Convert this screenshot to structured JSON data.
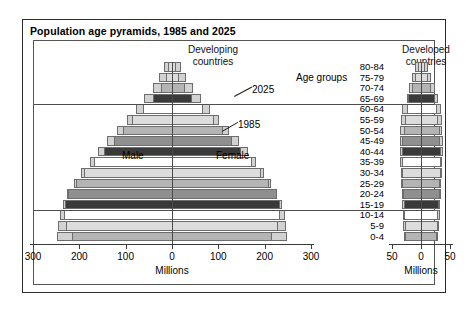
{
  "title": "Population age pyramids, 1985 and 2025",
  "panels": {
    "left_heading_line1": "Developing",
    "left_heading_line2": "countries",
    "right_heading_line1": "Developed",
    "right_heading_line2": "countries"
  },
  "annotations": {
    "male": "Male",
    "female": "Female",
    "year_outer": "2025",
    "year_inner": "1985",
    "age_groups_title": "Age groups"
  },
  "axis": {
    "left_title": "Millions",
    "right_title": "Millions",
    "left_ticks": [
      "300",
      "200",
      "100",
      "0",
      "100",
      "200",
      "300"
    ],
    "right_ticks": [
      "50",
      "0",
      "50"
    ]
  },
  "colors": {
    "outer_2025": "#d2d2d2",
    "bar_border": "#6d6d6d",
    "frame": "#2b2b2b",
    "text": "#000000",
    "shade_white": "#ffffff",
    "shade_light": "#dcdcdc",
    "shade_mid": "#b4b4b4",
    "shade_dark": "#8f8f8f",
    "shade_darker": "#707070",
    "shade_darkest": "#3a3a3a"
  },
  "chart_data": {
    "type": "bar",
    "title": "Population age pyramids, 1985 and 2025",
    "subtype": "population-pyramid",
    "xlabel": "Millions",
    "ylabel": "Age groups",
    "grid": false,
    "legend": [
      "2025",
      "1985"
    ],
    "age_groups": [
      "80-84",
      "75-79",
      "70-74",
      "65-69",
      "60-64",
      "55-59",
      "50-54",
      "45-49",
      "40-44",
      "35-39",
      "30-34",
      "25-29",
      "20-24",
      "15-19",
      "10-14",
      "5-9",
      "0-4"
    ],
    "panels": [
      {
        "name": "Developing countries",
        "xlim": [
          -300,
          300
        ],
        "xticks": [
          -300,
          -200,
          -100,
          0,
          100,
          200,
          300
        ],
        "series": [
          {
            "name": "2025",
            "male": [
              18,
              28,
              42,
              60,
              78,
              98,
              118,
              140,
              160,
              178,
              196,
              212,
              226,
              236,
              242,
              246,
              248
            ],
            "female": [
              20,
              30,
              45,
              63,
              82,
              102,
              122,
              144,
              163,
              181,
              198,
              214,
              227,
              237,
              243,
              246,
              248
            ]
          },
          {
            "name": "1985",
            "male": [
              8,
              14,
              24,
              40,
              62,
              86,
              106,
              126,
              146,
              168,
              190,
              208,
              224,
              232,
              234,
              228,
              216
            ],
            "female": [
              9,
              16,
              27,
              44,
              66,
              90,
              110,
              130,
              150,
              172,
              193,
              210,
              226,
              233,
              234,
              228,
              216
            ]
          }
        ],
        "shades": [
          "light",
          "light",
          "mid",
          "darkest",
          "white",
          "light",
          "mid",
          "dark",
          "darkest",
          "white",
          "light",
          "mid",
          "dark",
          "darkest",
          "white",
          "light",
          "mid"
        ]
      },
      {
        "name": "Developed countries",
        "xlim": [
          -50,
          50
        ],
        "xticks": [
          -50,
          0,
          50
        ],
        "series": [
          {
            "name": "2025",
            "male": [
              10,
              15,
              20,
              25,
              32,
              35,
              36,
              37,
              37,
              36,
              35,
              34,
              33,
              32,
              31,
              31,
              30
            ],
            "female": [
              12,
              18,
              24,
              29,
              34,
              36,
              37,
              38,
              38,
              37,
              36,
              35,
              34,
              33,
              32,
              31,
              30
            ]
          },
          {
            "name": "1985",
            "male": [
              6,
              10,
              16,
              22,
              25,
              28,
              30,
              32,
              33,
              33,
              33,
              32,
              31,
              30,
              29,
              28,
              27
            ],
            "female": [
              7,
              12,
              18,
              24,
              27,
              30,
              32,
              33,
              34,
              34,
              34,
              33,
              32,
              31,
              30,
              29,
              28
            ]
          }
        ],
        "shades": [
          "light",
          "light",
          "mid",
          "darkest",
          "white",
          "light",
          "mid",
          "dark",
          "darkest",
          "white",
          "light",
          "mid",
          "dark",
          "darkest",
          "white",
          "light",
          "mid"
        ]
      }
    ],
    "reference_lines": [
      {
        "between": "65-69 / 60-64"
      },
      {
        "between": "15-19 / 10-14"
      }
    ]
  }
}
